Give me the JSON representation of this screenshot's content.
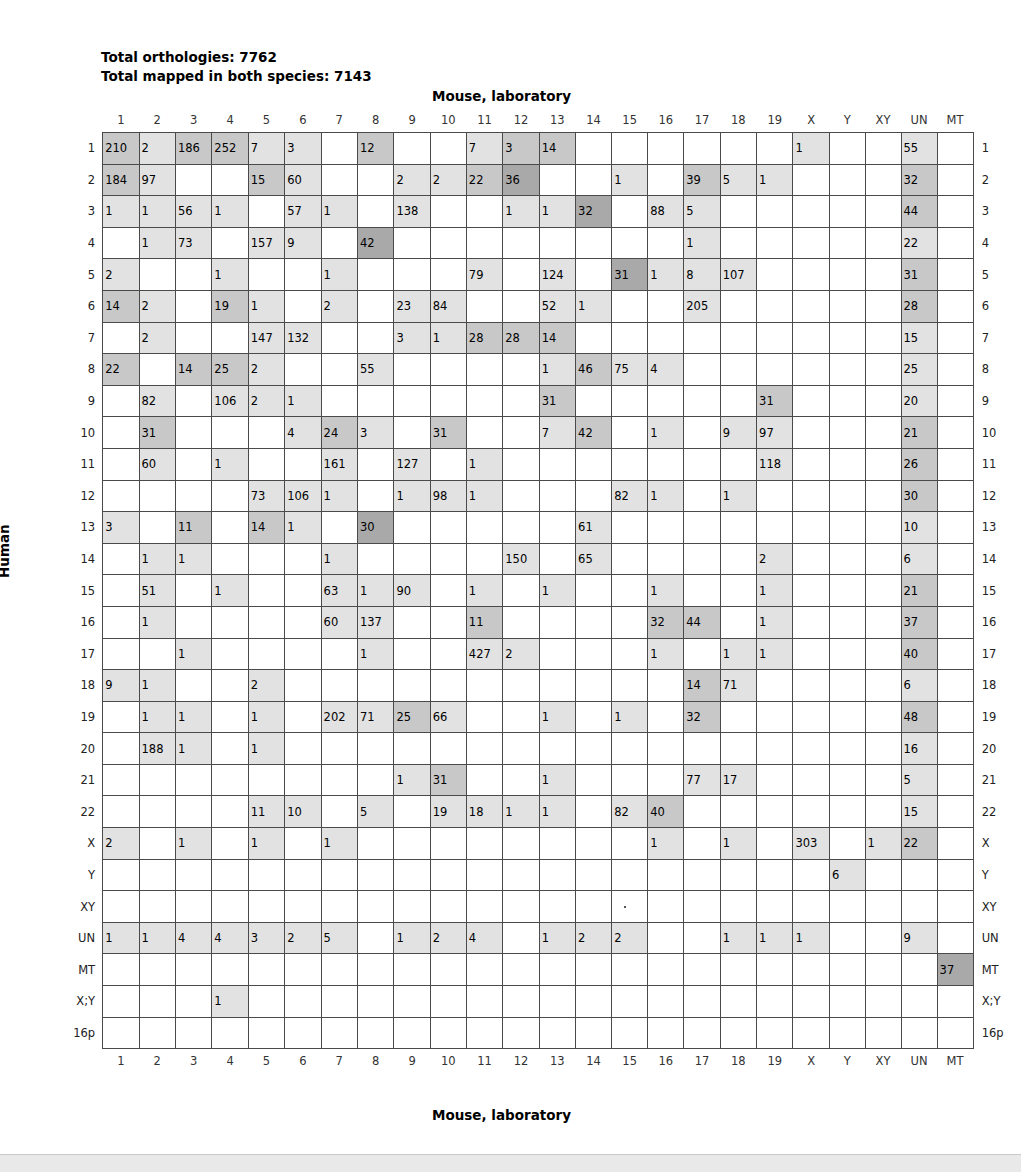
{
  "header": {
    "total_orthologies_label": "Total orthologies: 7762",
    "total_mapped_label": "Total mapped in both species: 7143",
    "top_axis_title": "Mouse, laboratory",
    "bottom_axis_title": "Mouse, laboratory",
    "left_axis_title": "Human",
    "right_axis_title": "Human"
  },
  "chart_data": {
    "type": "heatmap",
    "xlabel": "Mouse, laboratory",
    "ylabel": "Human",
    "grid": true,
    "legend_position": "none",
    "annotations": [
      "Total orthologies: 7762",
      "Total mapped in both species: 7143"
    ],
    "columns": [
      "1",
      "2",
      "3",
      "4",
      "5",
      "6",
      "7",
      "8",
      "9",
      "10",
      "11",
      "12",
      "13",
      "14",
      "15",
      "16",
      "17",
      "18",
      "19",
      "X",
      "Y",
      "XY",
      "UN",
      "MT"
    ],
    "rows": [
      "1",
      "2",
      "3",
      "4",
      "5",
      "6",
      "7",
      "8",
      "9",
      "10",
      "11",
      "12",
      "13",
      "14",
      "15",
      "16",
      "17",
      "18",
      "19",
      "20",
      "21",
      "22",
      "X",
      "Y",
      "XY",
      "UN",
      "MT",
      "X;Y",
      "16p"
    ],
    "values": [
      [
        210,
        2,
        186,
        252,
        7,
        3,
        null,
        12,
        null,
        null,
        7,
        3,
        14,
        null,
        null,
        null,
        null,
        null,
        null,
        1,
        null,
        null,
        55,
        null
      ],
      [
        184,
        97,
        null,
        null,
        15,
        60,
        null,
        null,
        2,
        2,
        22,
        36,
        null,
        null,
        1,
        null,
        39,
        5,
        1,
        null,
        null,
        null,
        32,
        null
      ],
      [
        1,
        1,
        56,
        1,
        null,
        57,
        1,
        null,
        138,
        null,
        null,
        1,
        1,
        32,
        null,
        88,
        5,
        null,
        null,
        null,
        null,
        null,
        44,
        null
      ],
      [
        null,
        1,
        73,
        null,
        157,
        9,
        null,
        42,
        null,
        null,
        null,
        null,
        null,
        null,
        null,
        null,
        1,
        null,
        null,
        null,
        null,
        null,
        22,
        null
      ],
      [
        2,
        null,
        null,
        1,
        null,
        null,
        1,
        null,
        null,
        null,
        79,
        null,
        124,
        null,
        31,
        1,
        8,
        107,
        null,
        null,
        null,
        null,
        31,
        null
      ],
      [
        14,
        2,
        null,
        19,
        1,
        null,
        2,
        null,
        23,
        84,
        null,
        null,
        52,
        1,
        null,
        null,
        205,
        null,
        null,
        null,
        null,
        null,
        28,
        null
      ],
      [
        null,
        2,
        null,
        null,
        147,
        132,
        null,
        null,
        3,
        1,
        28,
        28,
        14,
        null,
        null,
        null,
        null,
        null,
        null,
        null,
        null,
        null,
        15,
        null
      ],
      [
        22,
        null,
        14,
        25,
        2,
        null,
        null,
        55,
        null,
        null,
        null,
        null,
        1,
        46,
        75,
        4,
        null,
        null,
        null,
        null,
        null,
        null,
        25,
        null
      ],
      [
        null,
        82,
        null,
        106,
        2,
        1,
        null,
        null,
        null,
        null,
        null,
        null,
        31,
        null,
        null,
        null,
        null,
        null,
        31,
        null,
        null,
        null,
        20,
        null
      ],
      [
        null,
        31,
        null,
        null,
        null,
        4,
        24,
        3,
        null,
        31,
        null,
        null,
        7,
        42,
        null,
        1,
        null,
        9,
        97,
        null,
        null,
        null,
        21,
        null
      ],
      [
        null,
        60,
        null,
        1,
        null,
        null,
        161,
        null,
        127,
        null,
        1,
        null,
        null,
        null,
        null,
        null,
        null,
        null,
        118,
        null,
        null,
        null,
        26,
        null
      ],
      [
        null,
        null,
        null,
        null,
        73,
        106,
        1,
        null,
        1,
        98,
        1,
        null,
        null,
        null,
        82,
        1,
        null,
        1,
        null,
        null,
        null,
        null,
        30,
        null
      ],
      [
        3,
        null,
        11,
        null,
        14,
        1,
        null,
        30,
        null,
        null,
        null,
        null,
        null,
        61,
        null,
        null,
        null,
        null,
        null,
        null,
        null,
        null,
        10,
        null
      ],
      [
        null,
        1,
        1,
        null,
        null,
        null,
        1,
        null,
        null,
        null,
        null,
        150,
        null,
        65,
        null,
        null,
        null,
        null,
        2,
        null,
        null,
        null,
        6,
        null
      ],
      [
        null,
        51,
        null,
        1,
        null,
        null,
        63,
        1,
        90,
        null,
        1,
        null,
        1,
        null,
        null,
        1,
        null,
        null,
        1,
        null,
        null,
        null,
        21,
        null
      ],
      [
        null,
        1,
        null,
        null,
        null,
        null,
        60,
        137,
        null,
        null,
        11,
        null,
        null,
        null,
        null,
        32,
        44,
        null,
        1,
        null,
        null,
        null,
        37,
        null
      ],
      [
        null,
        null,
        1,
        null,
        null,
        null,
        null,
        1,
        null,
        null,
        427,
        2,
        null,
        null,
        null,
        1,
        null,
        1,
        1,
        null,
        null,
        null,
        40,
        null
      ],
      [
        9,
        1,
        null,
        null,
        2,
        null,
        null,
        null,
        null,
        null,
        null,
        null,
        null,
        null,
        null,
        null,
        14,
        71,
        null,
        null,
        null,
        null,
        6,
        null
      ],
      [
        null,
        1,
        1,
        null,
        1,
        null,
        202,
        71,
        25,
        66,
        null,
        null,
        1,
        null,
        1,
        null,
        32,
        null,
        null,
        null,
        null,
        null,
        48,
        null
      ],
      [
        null,
        188,
        1,
        null,
        1,
        null,
        null,
        null,
        null,
        null,
        null,
        null,
        null,
        null,
        null,
        null,
        null,
        null,
        null,
        null,
        null,
        null,
        16,
        null
      ],
      [
        null,
        null,
        null,
        null,
        null,
        null,
        null,
        null,
        1,
        31,
        null,
        null,
        1,
        null,
        null,
        null,
        77,
        17,
        null,
        null,
        null,
        null,
        5,
        null
      ],
      [
        null,
        null,
        null,
        null,
        11,
        10,
        null,
        5,
        null,
        19,
        18,
        1,
        1,
        null,
        82,
        40,
        null,
        null,
        null,
        null,
        null,
        null,
        15,
        null
      ],
      [
        2,
        null,
        1,
        null,
        1,
        null,
        1,
        null,
        null,
        null,
        null,
        null,
        null,
        null,
        null,
        1,
        null,
        1,
        null,
        303,
        null,
        1,
        22,
        null
      ],
      [
        null,
        null,
        null,
        null,
        null,
        null,
        null,
        null,
        null,
        null,
        null,
        null,
        null,
        null,
        null,
        null,
        null,
        null,
        null,
        null,
        6,
        null,
        null,
        null
      ],
      [
        null,
        null,
        null,
        null,
        null,
        null,
        null,
        null,
        null,
        null,
        null,
        null,
        null,
        null,
        null,
        null,
        null,
        null,
        null,
        null,
        null,
        null,
        null,
        null
      ],
      [
        1,
        1,
        4,
        4,
        3,
        2,
        5,
        null,
        1,
        2,
        4,
        null,
        1,
        2,
        2,
        null,
        null,
        1,
        1,
        1,
        null,
        null,
        9,
        null
      ],
      [
        null,
        null,
        null,
        null,
        null,
        null,
        null,
        null,
        null,
        null,
        null,
        null,
        null,
        null,
        null,
        null,
        null,
        null,
        null,
        null,
        null,
        null,
        null,
        37
      ],
      [
        null,
        null,
        null,
        1,
        null,
        null,
        null,
        null,
        null,
        null,
        null,
        null,
        null,
        null,
        null,
        null,
        null,
        null,
        null,
        null,
        null,
        null,
        null,
        null
      ],
      [
        null,
        null,
        null,
        null,
        null,
        null,
        null,
        null,
        null,
        null,
        null,
        null,
        null,
        null,
        null,
        null,
        null,
        null,
        null,
        null,
        null,
        null,
        null,
        null
      ]
    ],
    "shade_levels": [
      [
        2,
        1,
        2,
        2,
        1,
        1,
        0,
        2,
        0,
        0,
        1,
        2,
        2,
        0,
        0,
        0,
        0,
        0,
        0,
        1,
        0,
        0,
        1,
        0
      ],
      [
        2,
        1,
        0,
        0,
        2,
        1,
        0,
        0,
        1,
        1,
        2,
        3,
        0,
        0,
        1,
        0,
        2,
        1,
        1,
        0,
        0,
        0,
        2,
        0
      ],
      [
        1,
        1,
        1,
        1,
        0,
        1,
        1,
        0,
        1,
        0,
        0,
        1,
        1,
        3,
        0,
        1,
        1,
        0,
        0,
        0,
        0,
        0,
        2,
        0
      ],
      [
        0,
        1,
        1,
        0,
        1,
        1,
        0,
        3,
        0,
        0,
        0,
        0,
        0,
        0,
        0,
        0,
        1,
        0,
        0,
        0,
        0,
        0,
        1,
        0
      ],
      [
        1,
        0,
        0,
        1,
        0,
        0,
        1,
        0,
        0,
        0,
        1,
        0,
        1,
        0,
        3,
        1,
        1,
        1,
        0,
        0,
        0,
        0,
        2,
        0
      ],
      [
        2,
        1,
        0,
        2,
        1,
        0,
        1,
        0,
        1,
        1,
        0,
        0,
        1,
        1,
        0,
        0,
        1,
        0,
        0,
        0,
        0,
        0,
        2,
        0
      ],
      [
        0,
        1,
        0,
        0,
        1,
        1,
        0,
        0,
        1,
        1,
        2,
        2,
        2,
        0,
        0,
        0,
        0,
        0,
        0,
        0,
        0,
        0,
        1,
        0
      ],
      [
        2,
        0,
        2,
        2,
        1,
        0,
        0,
        1,
        0,
        0,
        0,
        0,
        1,
        2,
        1,
        1,
        0,
        0,
        0,
        0,
        0,
        0,
        1,
        0
      ],
      [
        0,
        1,
        0,
        1,
        1,
        1,
        0,
        0,
        0,
        0,
        0,
        0,
        2,
        0,
        0,
        0,
        0,
        0,
        2,
        0,
        0,
        0,
        1,
        0
      ],
      [
        0,
        2,
        0,
        0,
        0,
        1,
        2,
        1,
        0,
        2,
        0,
        0,
        1,
        2,
        0,
        1,
        0,
        1,
        1,
        0,
        0,
        0,
        2,
        0
      ],
      [
        0,
        1,
        0,
        1,
        0,
        0,
        1,
        0,
        1,
        0,
        1,
        0,
        0,
        0,
        0,
        0,
        0,
        0,
        1,
        0,
        0,
        0,
        2,
        0
      ],
      [
        0,
        0,
        0,
        0,
        1,
        1,
        1,
        0,
        1,
        1,
        1,
        0,
        0,
        0,
        1,
        1,
        0,
        1,
        0,
        0,
        0,
        0,
        2,
        0
      ],
      [
        1,
        0,
        2,
        0,
        2,
        1,
        0,
        3,
        0,
        0,
        0,
        0,
        0,
        1,
        0,
        0,
        0,
        0,
        0,
        0,
        0,
        0,
        1,
        0
      ],
      [
        0,
        1,
        1,
        0,
        0,
        0,
        1,
        0,
        0,
        0,
        0,
        1,
        0,
        1,
        0,
        0,
        0,
        0,
        1,
        0,
        0,
        0,
        1,
        0
      ],
      [
        0,
        1,
        0,
        1,
        0,
        0,
        1,
        1,
        1,
        0,
        1,
        0,
        1,
        0,
        0,
        1,
        0,
        0,
        1,
        0,
        0,
        0,
        2,
        0
      ],
      [
        0,
        1,
        0,
        0,
        0,
        0,
        1,
        1,
        0,
        0,
        2,
        0,
        0,
        0,
        0,
        2,
        2,
        0,
        1,
        0,
        0,
        0,
        2,
        0
      ],
      [
        0,
        0,
        1,
        0,
        0,
        0,
        0,
        1,
        0,
        0,
        1,
        1,
        0,
        0,
        0,
        1,
        0,
        1,
        1,
        0,
        0,
        0,
        2,
        0
      ],
      [
        1,
        1,
        0,
        0,
        1,
        0,
        0,
        0,
        0,
        0,
        0,
        0,
        0,
        0,
        0,
        0,
        2,
        1,
        0,
        0,
        0,
        0,
        1,
        0
      ],
      [
        0,
        1,
        1,
        0,
        1,
        0,
        1,
        1,
        2,
        1,
        0,
        0,
        1,
        0,
        1,
        0,
        2,
        0,
        0,
        0,
        0,
        0,
        2,
        0
      ],
      [
        0,
        1,
        1,
        0,
        1,
        0,
        0,
        0,
        0,
        0,
        0,
        0,
        0,
        0,
        0,
        0,
        0,
        0,
        0,
        0,
        0,
        0,
        1,
        0
      ],
      [
        0,
        0,
        0,
        0,
        0,
        0,
        0,
        0,
        1,
        2,
        0,
        0,
        1,
        0,
        0,
        0,
        1,
        1,
        0,
        0,
        0,
        0,
        1,
        0
      ],
      [
        0,
        0,
        0,
        0,
        1,
        1,
        0,
        1,
        0,
        1,
        1,
        1,
        1,
        0,
        1,
        2,
        0,
        0,
        0,
        0,
        0,
        0,
        1,
        0
      ],
      [
        1,
        0,
        1,
        0,
        1,
        0,
        1,
        0,
        0,
        0,
        0,
        0,
        0,
        0,
        0,
        1,
        0,
        1,
        0,
        1,
        0,
        1,
        2,
        0
      ],
      [
        0,
        0,
        0,
        0,
        0,
        0,
        0,
        0,
        0,
        0,
        0,
        0,
        0,
        0,
        0,
        0,
        0,
        0,
        0,
        0,
        1,
        0,
        0,
        0
      ],
      [
        0,
        0,
        0,
        0,
        0,
        0,
        0,
        0,
        0,
        0,
        0,
        0,
        0,
        0,
        0,
        0,
        0,
        0,
        0,
        0,
        0,
        0,
        0,
        0
      ],
      [
        1,
        1,
        1,
        1,
        1,
        1,
        1,
        0,
        1,
        1,
        1,
        0,
        1,
        1,
        1,
        0,
        0,
        1,
        1,
        1,
        0,
        0,
        1,
        0
      ],
      [
        0,
        0,
        0,
        0,
        0,
        0,
        0,
        0,
        0,
        0,
        0,
        0,
        0,
        0,
        0,
        0,
        0,
        0,
        0,
        0,
        0,
        0,
        0,
        3
      ],
      [
        0,
        0,
        0,
        1,
        0,
        0,
        0,
        0,
        0,
        0,
        0,
        0,
        0,
        0,
        0,
        0,
        0,
        0,
        0,
        0,
        0,
        0,
        0,
        0
      ],
      [
        0,
        0,
        0,
        0,
        0,
        0,
        0,
        0,
        0,
        0,
        0,
        0,
        0,
        0,
        0,
        0,
        0,
        0,
        0,
        0,
        0,
        0,
        0,
        0
      ]
    ],
    "special_marks": {
      "xy_row_dot_column_index": 14
    },
    "shade_colors": {
      "level0": "#ffffff",
      "level1": "#e2e2e2",
      "level2": "#c8c8c8",
      "level3": "#a9a9a9"
    }
  }
}
